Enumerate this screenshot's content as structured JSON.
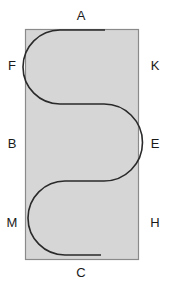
{
  "diagram": {
    "type": "serpentine-path-in-rectangle",
    "colors": {
      "fill": "#d6d6d6",
      "border": "#8a8a8a",
      "path": "#2a2a2a",
      "text": "#1a1a1a"
    },
    "labels": {
      "top": "A",
      "bottom": "C",
      "left_top": "F",
      "left_middle": "B",
      "left_bottom": "M",
      "right_top": "K",
      "right_middle": "E",
      "right_bottom": "H"
    }
  }
}
